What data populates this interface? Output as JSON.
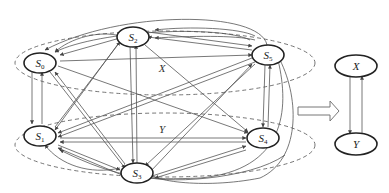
{
  "diagram": {
    "left_graph": {
      "groups": [
        {
          "id": "X",
          "label": "X",
          "members": [
            "S0",
            "S2",
            "S5"
          ]
        },
        {
          "id": "Y",
          "label": "Y",
          "members": [
            "S1",
            "S3",
            "S4"
          ]
        }
      ],
      "nodes": [
        {
          "id": "S0",
          "base": "S",
          "sub": "0"
        },
        {
          "id": "S2",
          "base": "S",
          "sub": "2"
        },
        {
          "id": "S5",
          "base": "S",
          "sub": "5"
        },
        {
          "id": "S1",
          "base": "S",
          "sub": "1"
        },
        {
          "id": "S3",
          "base": "S",
          "sub": "3"
        },
        {
          "id": "S4",
          "base": "S",
          "sub": "4"
        }
      ],
      "edges_description": "Fully connected directed graph; every state has edges to every other state"
    },
    "transform_arrow": "hollow right arrow",
    "right_graph": {
      "nodes": [
        {
          "id": "X",
          "label": "X"
        },
        {
          "id": "Y",
          "label": "Y"
        }
      ],
      "edges": [
        {
          "from": "X",
          "to": "Y"
        },
        {
          "from": "Y",
          "to": "X"
        }
      ]
    },
    "colors": {
      "node_stroke": "#222222",
      "edge": "#555555",
      "group_dashed": "#666666"
    }
  }
}
